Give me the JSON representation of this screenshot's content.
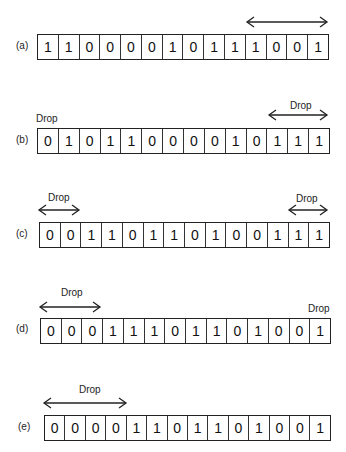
{
  "diagram": {
    "drop_label": "Drop",
    "rows": [
      {
        "label": "(a)",
        "bits": [
          "1",
          "1",
          "0",
          "0",
          "0",
          "0",
          "1",
          "0",
          "1",
          "1",
          "1",
          "0",
          "0",
          "1"
        ]
      },
      {
        "label": "(b)",
        "bits": [
          "0",
          "1",
          "0",
          "1",
          "1",
          "0",
          "0",
          "0",
          "0",
          "1",
          "0",
          "1",
          "1",
          "1"
        ]
      },
      {
        "label": "(c)",
        "bits": [
          "0",
          "0",
          "1",
          "1",
          "0",
          "1",
          "1",
          "0",
          "1",
          "0",
          "0",
          "1",
          "1",
          "1"
        ]
      },
      {
        "label": "(d)",
        "bits": [
          "0",
          "0",
          "0",
          "1",
          "1",
          "1",
          "0",
          "1",
          "1",
          "0",
          "1",
          "0",
          "0",
          "1"
        ]
      },
      {
        "label": "(e)",
        "bits": [
          "0",
          "0",
          "0",
          "0",
          "1",
          "1",
          "0",
          "1",
          "1",
          "0",
          "1",
          "0",
          "0",
          "1"
        ]
      }
    ]
  }
}
